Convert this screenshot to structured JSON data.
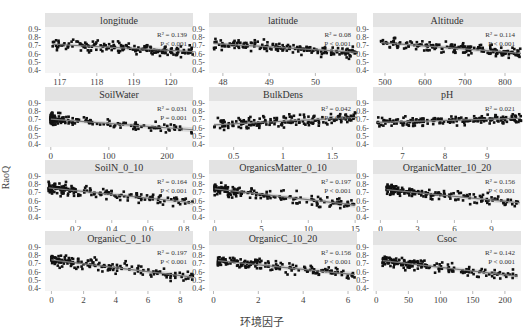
{
  "figure": {
    "y_axis_label": "RaoQ",
    "x_axis_label": "环境因子",
    "colors": {
      "strip_bg": "#e3e3e3",
      "panel_bg": "#f4f4f4",
      "point": "#111111",
      "fit_line": "#7a7a7a",
      "ci_band": "#c8c8c8",
      "text": "#444444"
    }
  },
  "chart_data": [
    {
      "type": "scatter",
      "title": "longitude",
      "r2_label": "R² = 0.139",
      "p_label": "P < 0.001",
      "xticks": [
        117,
        118,
        119,
        120
      ],
      "xlim": [
        116.6,
        120.6
      ],
      "yticks": [
        0.4,
        0.5,
        0.6,
        0.7,
        0.8,
        0.9
      ],
      "ylim": [
        0.37,
        0.93
      ],
      "fit": {
        "x0": 116.8,
        "y0": 0.72,
        "x1": 120.6,
        "y1": 0.63
      },
      "ylabel": "RaoQ"
    },
    {
      "type": "scatter",
      "title": "latitude",
      "r2_label": "R² = 0.08",
      "p_label": "P < 0.001",
      "xticks": [
        48,
        49,
        50
      ],
      "xlim": [
        47.7,
        50.9
      ],
      "yticks": [
        0.4,
        0.5,
        0.6,
        0.7,
        0.8,
        0.9
      ],
      "ylim": [
        0.37,
        0.93
      ],
      "fit": {
        "x0": 47.8,
        "y0": 0.73,
        "x1": 50.9,
        "y1": 0.62
      },
      "ylabel": "RaoQ"
    },
    {
      "type": "scatter",
      "title": "Altitude",
      "r2_label": "R² = 0.114",
      "p_label": "P < 0.001",
      "xticks": [
        500,
        600,
        700,
        800
      ],
      "xlim": [
        470,
        840
      ],
      "yticks": [
        0.4,
        0.5,
        0.6,
        0.7,
        0.8,
        0.9
      ],
      "ylim": [
        0.37,
        0.93
      ],
      "fit": {
        "x0": 490,
        "y0": 0.74,
        "x1": 840,
        "y1": 0.61
      },
      "ylabel": "RaoQ"
    },
    {
      "type": "scatter",
      "title": "SoilWater",
      "r2_label": "R² = 0.031",
      "p_label": "P = 0.001",
      "xticks": [
        0,
        100,
        200
      ],
      "xlim": [
        -10,
        245
      ],
      "yticks": [
        0.4,
        0.5,
        0.6,
        0.7,
        0.8,
        0.9
      ],
      "ylim": [
        0.37,
        0.93
      ],
      "fit": {
        "x0": 0,
        "y0": 0.71,
        "x1": 245,
        "y1": 0.58
      },
      "ylabel": "RaoQ"
    },
    {
      "type": "scatter",
      "title": "BulkDens",
      "r2_label": "R² = 0.042",
      "p_label": "P < 0.001",
      "xticks": [
        0.5,
        1.0,
        1.5
      ],
      "xlim": [
        0.25,
        1.75
      ],
      "yticks": [
        0.4,
        0.5,
        0.6,
        0.7,
        0.8,
        0.9
      ],
      "ylim": [
        0.37,
        0.93
      ],
      "fit": {
        "x0": 0.3,
        "y0": 0.64,
        "x1": 1.75,
        "y1": 0.73
      },
      "ylabel": "RaoQ"
    },
    {
      "type": "scatter",
      "title": "pH",
      "r2_label": "R² = 0.021",
      "p_label": "",
      "xticks": [
        7,
        8,
        9
      ],
      "xlim": [
        6.3,
        9.8
      ],
      "yticks": [
        0.4,
        0.5,
        0.6,
        0.7,
        0.8,
        0.9
      ],
      "ylim": [
        0.37,
        0.93
      ],
      "fit": {
        "x0": 6.4,
        "y0": 0.67,
        "x1": 9.8,
        "y1": 0.72
      },
      "ylabel": "RaoQ"
    },
    {
      "type": "scatter",
      "title": "SoilN_0_10",
      "r2_label": "R² = 0.164",
      "p_label": "P < 0.001",
      "xticks": [
        0.2,
        0.4,
        0.6,
        0.8
      ],
      "xlim": [
        0.03,
        0.85
      ],
      "yticks": [
        0.4,
        0.5,
        0.6,
        0.7,
        0.8,
        0.9
      ],
      "ylim": [
        0.37,
        0.93
      ],
      "fit": {
        "x0": 0.05,
        "y0": 0.76,
        "x1": 0.85,
        "y1": 0.58
      },
      "ylabel": "RaoQ"
    },
    {
      "type": "scatter",
      "title": "OrganicsMatter_0_10",
      "r2_label": "R² = 0.197",
      "p_label": "P < 0.001",
      "xticks": [
        0,
        5,
        10,
        15
      ],
      "xlim": [
        -0.6,
        15.2
      ],
      "yticks": [
        0.4,
        0.5,
        0.6,
        0.7,
        0.8,
        0.9
      ],
      "ylim": [
        0.37,
        0.93
      ],
      "fit": {
        "x0": 0,
        "y0": 0.75,
        "x1": 15,
        "y1": 0.55
      },
      "ylabel": "RaoQ"
    },
    {
      "type": "scatter",
      "title": "OrganicMatter_10_20",
      "r2_label": "R² = 0.156",
      "p_label": "P < 0.001",
      "xticks": [
        0,
        3,
        6,
        9
      ],
      "xlim": [
        -0.6,
        11.4
      ],
      "yticks": [
        0.4,
        0.5,
        0.6,
        0.7,
        0.8,
        0.9
      ],
      "ylim": [
        0.37,
        0.93
      ],
      "fit": {
        "x0": 0.5,
        "y0": 0.74,
        "x1": 11.3,
        "y1": 0.58
      },
      "ylabel": "RaoQ"
    },
    {
      "type": "scatter",
      "title": "OrganicC_0_10",
      "r2_label": "R² = 0.197",
      "p_label": "P < 0.001",
      "xticks": [
        0,
        2,
        4,
        6,
        8
      ],
      "xlim": [
        -0.4,
        8.8
      ],
      "yticks": [
        0.4,
        0.5,
        0.6,
        0.7,
        0.8,
        0.9
      ],
      "ylim": [
        0.37,
        0.93
      ],
      "fit": {
        "x0": 0,
        "y0": 0.75,
        "x1": 8.8,
        "y1": 0.54
      },
      "ylabel": "RaoQ"
    },
    {
      "type": "scatter",
      "title": "OrganicC_10_20",
      "r2_label": "R² = 0.156",
      "p_label": "P < 0.001",
      "xticks": [
        0,
        2,
        4,
        6
      ],
      "xlim": [
        -0.2,
        6.4
      ],
      "yticks": [
        0.4,
        0.5,
        0.6,
        0.7,
        0.8,
        0.9
      ],
      "ylim": [
        0.37,
        0.93
      ],
      "fit": {
        "x0": 0.2,
        "y0": 0.74,
        "x1": 6.3,
        "y1": 0.57
      },
      "ylabel": "RaoQ"
    },
    {
      "type": "scatter",
      "title": "Csoc",
      "r2_label": "R² = 0.142",
      "p_label": "P < 0.001",
      "xticks": [
        0,
        50,
        100,
        150,
        200
      ],
      "xlim": [
        -5,
        225
      ],
      "yticks": [
        0.4,
        0.5,
        0.6,
        0.7,
        0.8,
        0.9
      ],
      "ylim": [
        0.37,
        0.93
      ],
      "fit": {
        "x0": 10,
        "y0": 0.74,
        "x1": 220,
        "y1": 0.55
      },
      "ylabel": "RaoQ"
    }
  ]
}
